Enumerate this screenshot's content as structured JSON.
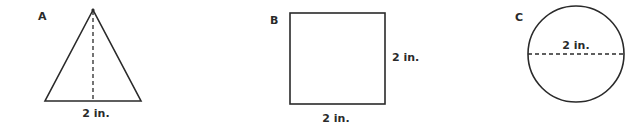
{
  "figures": [
    {
      "id": "A",
      "shape": "triangle",
      "label": "A",
      "dimension_label": "2 in.",
      "dimension_note": "base width with dashed height line"
    },
    {
      "id": "B",
      "shape": "square",
      "label": "B",
      "side_label": "2 in.",
      "bottom_label": "2 in."
    },
    {
      "id": "C",
      "shape": "circle",
      "label": "C",
      "diameter_label": "2 in."
    }
  ],
  "colors": {
    "stroke": "#2a2a2a",
    "background": "#ffffff"
  }
}
